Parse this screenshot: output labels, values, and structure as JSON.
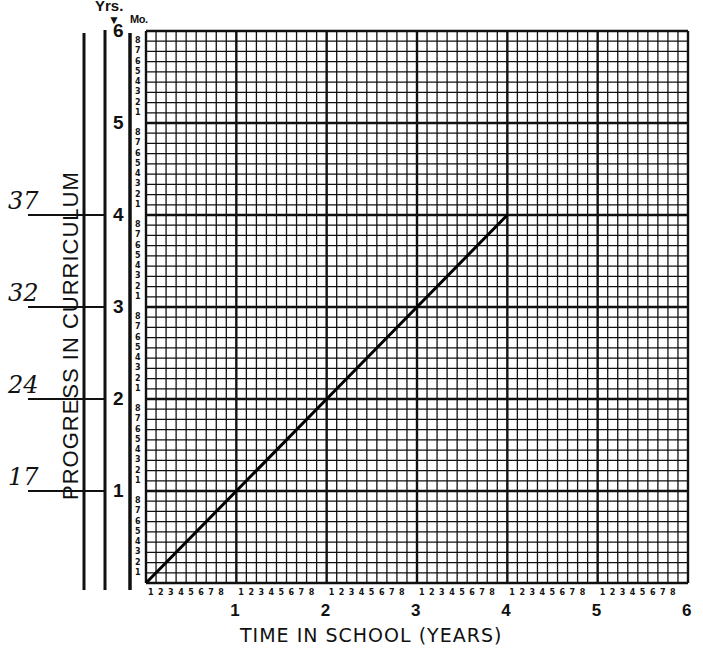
{
  "chart_data": {
    "type": "line",
    "title": "",
    "xlabel": "TIME IN SCHOOL (YEARS)",
    "ylabel": "PROGRESS IN CURRICULUM",
    "y_unit_labels": {
      "years": "Yrs.",
      "months": "Mo."
    },
    "xlim": [
      0,
      6
    ],
    "ylim": [
      0,
      6
    ],
    "x_major_ticks": [
      "1",
      "2",
      "3",
      "4",
      "5",
      "6"
    ],
    "y_major_ticks": [
      "1",
      "2",
      "3",
      "4",
      "5",
      "6"
    ],
    "minor_ticks_per_year": [
      "1",
      "2",
      "3",
      "4",
      "5",
      "6",
      "7",
      "8"
    ],
    "grid": true,
    "series": [
      {
        "name": "Expected progress",
        "x": [
          0,
          1,
          2,
          3,
          4
        ],
        "y": [
          0,
          1,
          2,
          3,
          4
        ]
      }
    ],
    "annotations": [
      {
        "text": "17",
        "y": 1
      },
      {
        "text": "24",
        "y": 2
      },
      {
        "text": "32",
        "y": 3
      },
      {
        "text": "37",
        "y": 4
      }
    ]
  }
}
